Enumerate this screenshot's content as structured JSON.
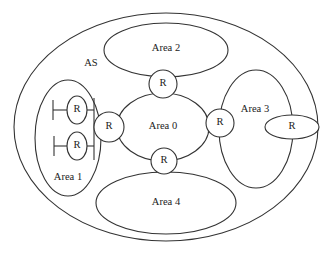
{
  "diagram": {
    "as_label": "AS",
    "areas": [
      {
        "id": "area0",
        "label": "Area 0"
      },
      {
        "id": "area1",
        "label": "Area 1"
      },
      {
        "id": "area2",
        "label": "Area 2"
      },
      {
        "id": "area3",
        "label": "Area 3"
      },
      {
        "id": "area4",
        "label": "Area 4"
      }
    ],
    "routers": [
      {
        "id": "r-area0-area2",
        "label": "R"
      },
      {
        "id": "r-area0-area1",
        "label": "R"
      },
      {
        "id": "r-area0-area3",
        "label": "R"
      },
      {
        "id": "r-area0-area4",
        "label": "R"
      },
      {
        "id": "r-area3-internal",
        "label": "R"
      },
      {
        "id": "r-area1-internal-top",
        "label": "R"
      },
      {
        "id": "r-area1-internal-bottom",
        "label": "R"
      }
    ],
    "colors": {
      "stroke": "#333333",
      "background": "#ffffff",
      "text": "#222222"
    }
  }
}
